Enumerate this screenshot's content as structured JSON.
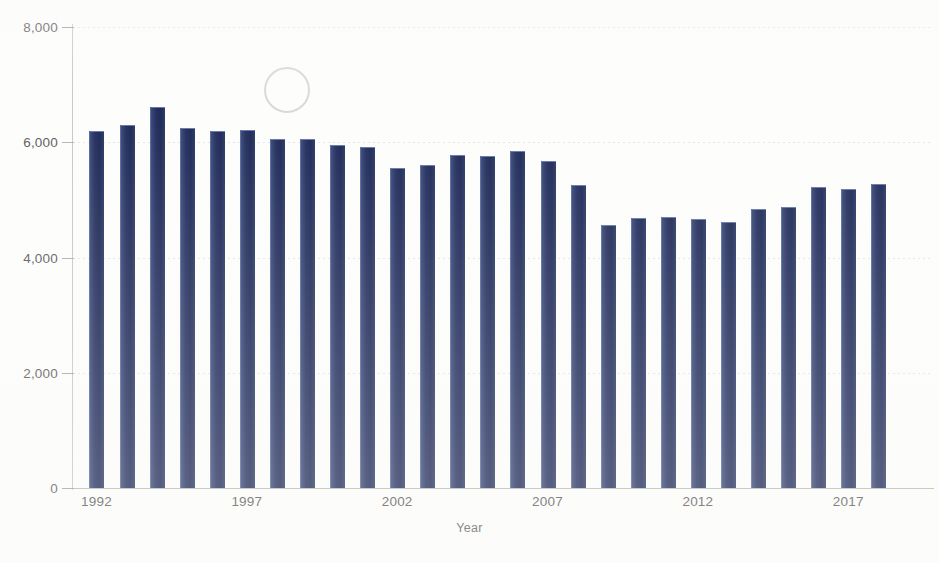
{
  "chart_data": {
    "type": "bar",
    "title": "",
    "xlabel": "Year",
    "ylabel": "",
    "ylim": [
      0,
      8000
    ],
    "ytick_values": [
      0,
      2000,
      4000,
      6000,
      8000
    ],
    "ytick_labels": [
      "0",
      "2,000",
      "4,000",
      "6,000",
      "8,000"
    ],
    "xtick_labels": [
      "1992",
      "1997",
      "2002",
      "2007",
      "2012",
      "2017"
    ],
    "xtick_categories": [
      "1992",
      "1997",
      "2002",
      "2007",
      "2012",
      "2017"
    ],
    "grid": true,
    "legend": null,
    "bar_color": "#23305e",
    "categories": [
      "1992",
      "1993",
      "1994",
      "1995",
      "1996",
      "1997",
      "1998",
      "1999",
      "2000",
      "2001",
      "2002",
      "2003",
      "2004",
      "2005",
      "2006",
      "2007",
      "2008",
      "2009",
      "2010",
      "2011",
      "2012",
      "2013",
      "2014",
      "2015",
      "2016",
      "2017",
      "2018"
    ],
    "values": [
      6190,
      6300,
      6610,
      6250,
      6200,
      6220,
      6050,
      6050,
      5950,
      5920,
      5550,
      5610,
      5780,
      5760,
      5840,
      5680,
      5250,
      4560,
      4690,
      4700,
      4660,
      4610,
      4840,
      4870,
      5230,
      5190,
      5280
    ],
    "annotations": [
      {
        "type": "circle",
        "label": "hand-drawn-circle-annotation",
        "x_center": 285,
        "y_center": 88,
        "radius": 21
      }
    ]
  },
  "axis": {
    "x_title": "Year"
  }
}
